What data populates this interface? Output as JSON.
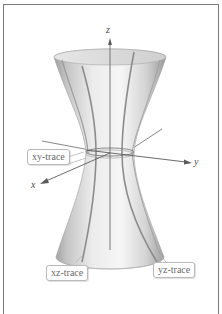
{
  "figure": {
    "axes": {
      "z": "z",
      "y": "y",
      "x": "x"
    },
    "labels": {
      "xy_trace": "xy-trace",
      "xz_trace": "xz-trace",
      "yz_trace": "yz-trace"
    },
    "colors": {
      "surface": "#d9d9d9",
      "trace": "#8c8c8c",
      "axis": "#5a5a5a",
      "frame": "#7a7a7a"
    }
  }
}
